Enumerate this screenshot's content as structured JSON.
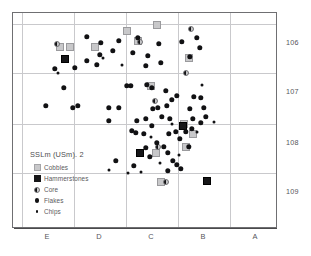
{
  "chart_data": {
    "type": "scatter",
    "title": "SSLm (USm). 2",
    "xlabel": "",
    "ylabel": "",
    "grid": true,
    "legend_position": "inside-lower-left",
    "x_categories": [
      "E",
      "D",
      "C",
      "B",
      "A"
    ],
    "y_ticks": [
      "106",
      "107",
      "108",
      "109"
    ],
    "y_tick_values": [
      106,
      107,
      108,
      109
    ],
    "x_axis_note": "columns E D C B A from left to right, gridlines separate columns",
    "series": [
      {
        "name": "Cobbles",
        "marker": "light-gray-square",
        "color": "#c8c8ca",
        "points": [
          [
            59,
            46
          ],
          [
            69,
            46
          ],
          [
            94,
            46
          ],
          [
            137,
            40
          ],
          [
            156,
            24
          ],
          [
            126,
            30
          ],
          [
            150,
            85
          ],
          [
            188,
            57
          ],
          [
            185,
            146
          ],
          [
            192,
            133
          ],
          [
            155,
            152
          ],
          [
            160,
            181
          ],
          [
            183,
            123
          ]
        ]
      },
      {
        "name": "Hammerstones",
        "marker": "black-square",
        "color": "#161618",
        "points": [
          [
            64,
            58
          ],
          [
            182,
            125
          ],
          [
            139,
            152
          ],
          [
            206,
            180
          ]
        ]
      },
      {
        "name": "Core",
        "marker": "half-filled-circle",
        "color": "#111113",
        "points": [
          [
            56,
            43
          ],
          [
            154,
            100
          ],
          [
            157,
            146
          ],
          [
            165,
            181
          ],
          [
            185,
            72
          ],
          [
            190,
            28
          ],
          [
            139,
            41
          ]
        ]
      },
      {
        "name": "Flakes",
        "marker": "filled-circle",
        "color": "#111113",
        "points": [
          [
            86,
            36
          ],
          [
            100,
            42
          ],
          [
            118,
            40
          ],
          [
            137,
            37
          ],
          [
            158,
            43
          ],
          [
            132,
            52
          ],
          [
            147,
            55
          ],
          [
            112,
            50
          ],
          [
            99,
            54
          ],
          [
            145,
            65
          ],
          [
            160,
            62
          ],
          [
            86,
            60
          ],
          [
            74,
            67
          ],
          [
            54,
            68
          ],
          [
            181,
            41
          ],
          [
            196,
            37
          ],
          [
            199,
            47
          ],
          [
            189,
            56
          ],
          [
            130,
            85
          ],
          [
            146,
            84
          ],
          [
            152,
            108
          ],
          [
            166,
            105
          ],
          [
            157,
            107
          ],
          [
            176,
            95
          ],
          [
            169,
            118
          ],
          [
            189,
            108
          ],
          [
            203,
            107
          ],
          [
            205,
            116
          ],
          [
            200,
            122
          ],
          [
            192,
            118
          ],
          [
            185,
            131
          ],
          [
            191,
            128
          ],
          [
            175,
            131
          ],
          [
            168,
            133
          ],
          [
            179,
            138
          ],
          [
            151,
            125
          ],
          [
            131,
            130
          ],
          [
            135,
            132
          ],
          [
            143,
            133
          ],
          [
            156,
            142
          ],
          [
            163,
            146
          ],
          [
            167,
            152
          ],
          [
            172,
            160
          ],
          [
            176,
            164
          ],
          [
            180,
            168
          ],
          [
            145,
            118
          ],
          [
            118,
            107
          ],
          [
            108,
            107
          ],
          [
            77,
            105
          ],
          [
            45,
            105
          ],
          [
            72,
            107
          ],
          [
            108,
            120
          ],
          [
            126,
            85
          ],
          [
            151,
            87
          ],
          [
            165,
            90
          ],
          [
            63,
            87
          ],
          [
            115,
            160
          ],
          [
            133,
            165
          ],
          [
            200,
            97
          ],
          [
            171,
            99
          ],
          [
            161,
            116
          ],
          [
            193,
            96
          ],
          [
            145,
            147
          ],
          [
            149,
            156
          ],
          [
            96,
            64
          ],
          [
            188,
            146
          ],
          [
            167,
            170
          ],
          [
            136,
            120
          ]
        ]
      },
      {
        "name": "Chips",
        "marker": "small-dot",
        "color": "#111113",
        "points": [
          [
            127,
            172
          ],
          [
            140,
            171
          ],
          [
            201,
            84
          ],
          [
            108,
            169
          ],
          [
            57,
            72
          ],
          [
            102,
            57
          ],
          [
            121,
            64
          ],
          [
            213,
            121
          ],
          [
            196,
            131
          ],
          [
            171,
            123
          ],
          [
            150,
            136
          ],
          [
            159,
            162
          ],
          [
            178,
            154
          ]
        ]
      }
    ]
  },
  "legend": {
    "title": "SSLm (USm). 2",
    "items": [
      {
        "label": "Cobbles",
        "swatch": "cobble-square-icon"
      },
      {
        "label": "Hammerstones",
        "swatch": "hammerstone-square-icon"
      },
      {
        "label": "Core",
        "swatch": "core-half-circle-icon"
      },
      {
        "label": "Flakes",
        "swatch": "flake-dot-icon"
      },
      {
        "label": "Chips",
        "swatch": "chip-dot-icon"
      }
    ]
  },
  "axes": {
    "y_labels": [
      "106",
      "107",
      "108",
      "109"
    ],
    "x_labels": [
      "E",
      "D",
      "C",
      "B",
      "A"
    ]
  },
  "colors": {
    "cobble": "#c8c8ca",
    "hammerstone": "#161618",
    "marker": "#111113",
    "grid": "#c9c9cc",
    "frame": "#6f6f72",
    "text": "#55555a"
  },
  "caption": ""
}
